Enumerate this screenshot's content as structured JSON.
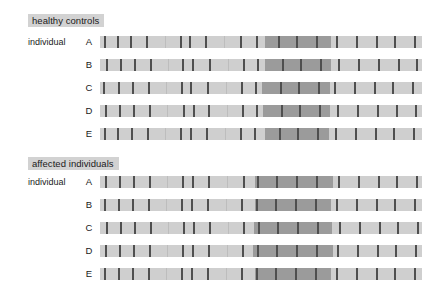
{
  "figure": {
    "width": 448,
    "height": 291,
    "background": "#ffffff",
    "track_color": "#cfcfcf",
    "shared_block_color": "#9b9b9b",
    "marker_color": "#6e6e6e",
    "title_chip_color": "#d2d2d2"
  },
  "panels": [
    {
      "id": "healthy-controls",
      "title": "healthy controls",
      "title_x": 28,
      "title_y": 14,
      "row_label_prefix": "individual",
      "prefix_x": 28,
      "prefix_y": 36,
      "rows": [
        {
          "letter": "A",
          "y": 36,
          "shared_blocks": [
            {
              "x": 265,
              "w": 66
            }
          ],
          "markers": [
            {
              "x": 104,
              "tone": "strong"
            },
            {
              "x": 117,
              "tone": "strong"
            },
            {
              "x": 130,
              "tone": "strong"
            },
            {
              "x": 146,
              "tone": "strong"
            },
            {
              "x": 165,
              "tone": "faint"
            },
            {
              "x": 180,
              "tone": "strong"
            },
            {
              "x": 189,
              "tone": "strong"
            },
            {
              "x": 205,
              "tone": "strong"
            },
            {
              "x": 224,
              "tone": "faint"
            },
            {
              "x": 240,
              "tone": "strong"
            },
            {
              "x": 256,
              "tone": "strong"
            },
            {
              "x": 278,
              "tone": "strong"
            },
            {
              "x": 296,
              "tone": "strong"
            },
            {
              "x": 316,
              "tone": "strong"
            },
            {
              "x": 336,
              "tone": "strong"
            },
            {
              "x": 356,
              "tone": "strong"
            },
            {
              "x": 376,
              "tone": "strong"
            },
            {
              "x": 394,
              "tone": "strong"
            },
            {
              "x": 414,
              "tone": "strong"
            }
          ]
        },
        {
          "letter": "B",
          "y": 59,
          "shared_blocks": [
            {
              "x": 265,
              "w": 66
            }
          ],
          "markers": [
            {
              "x": 106,
              "tone": "strong"
            },
            {
              "x": 120,
              "tone": "strong"
            },
            {
              "x": 134,
              "tone": "strong"
            },
            {
              "x": 150,
              "tone": "strong"
            },
            {
              "x": 168,
              "tone": "faint"
            },
            {
              "x": 182,
              "tone": "strong"
            },
            {
              "x": 192,
              "tone": "strong"
            },
            {
              "x": 209,
              "tone": "strong"
            },
            {
              "x": 228,
              "tone": "faint"
            },
            {
              "x": 243,
              "tone": "strong"
            },
            {
              "x": 257,
              "tone": "strong"
            },
            {
              "x": 282,
              "tone": "strong"
            },
            {
              "x": 300,
              "tone": "strong"
            },
            {
              "x": 320,
              "tone": "strong"
            },
            {
              "x": 338,
              "tone": "strong"
            },
            {
              "x": 358,
              "tone": "strong"
            },
            {
              "x": 378,
              "tone": "strong"
            },
            {
              "x": 398,
              "tone": "strong"
            },
            {
              "x": 416,
              "tone": "strong"
            }
          ]
        },
        {
          "letter": "C",
          "y": 82,
          "shared_blocks": [
            {
              "x": 262,
              "w": 68
            }
          ],
          "markers": [
            {
              "x": 103,
              "tone": "strong"
            },
            {
              "x": 118,
              "tone": "strong"
            },
            {
              "x": 132,
              "tone": "strong"
            },
            {
              "x": 148,
              "tone": "strong"
            },
            {
              "x": 166,
              "tone": "faint"
            },
            {
              "x": 181,
              "tone": "strong"
            },
            {
              "x": 190,
              "tone": "strong"
            },
            {
              "x": 207,
              "tone": "strong"
            },
            {
              "x": 226,
              "tone": "faint"
            },
            {
              "x": 241,
              "tone": "strong"
            },
            {
              "x": 255,
              "tone": "strong"
            },
            {
              "x": 280,
              "tone": "strong"
            },
            {
              "x": 298,
              "tone": "strong"
            },
            {
              "x": 318,
              "tone": "strong"
            },
            {
              "x": 334,
              "tone": "strong"
            },
            {
              "x": 354,
              "tone": "strong"
            },
            {
              "x": 374,
              "tone": "strong"
            },
            {
              "x": 392,
              "tone": "strong"
            },
            {
              "x": 412,
              "tone": "strong"
            }
          ]
        },
        {
          "letter": "D",
          "y": 105,
          "shared_blocks": [
            {
              "x": 263,
              "w": 67
            }
          ],
          "markers": [
            {
              "x": 105,
              "tone": "strong"
            },
            {
              "x": 119,
              "tone": "strong"
            },
            {
              "x": 133,
              "tone": "strong"
            },
            {
              "x": 149,
              "tone": "strong"
            },
            {
              "x": 167,
              "tone": "faint"
            },
            {
              "x": 183,
              "tone": "strong"
            },
            {
              "x": 193,
              "tone": "strong"
            },
            {
              "x": 208,
              "tone": "strong"
            },
            {
              "x": 227,
              "tone": "faint"
            },
            {
              "x": 242,
              "tone": "strong"
            },
            {
              "x": 256,
              "tone": "strong"
            },
            {
              "x": 281,
              "tone": "strong"
            },
            {
              "x": 299,
              "tone": "strong"
            },
            {
              "x": 319,
              "tone": "strong"
            },
            {
              "x": 337,
              "tone": "strong"
            },
            {
              "x": 357,
              "tone": "strong"
            },
            {
              "x": 377,
              "tone": "strong"
            },
            {
              "x": 396,
              "tone": "strong"
            },
            {
              "x": 415,
              "tone": "strong"
            }
          ]
        },
        {
          "letter": "E",
          "y": 128,
          "shared_blocks": [
            {
              "x": 265,
              "w": 64
            }
          ],
          "markers": [
            {
              "x": 104,
              "tone": "strong"
            },
            {
              "x": 117,
              "tone": "strong"
            },
            {
              "x": 131,
              "tone": "strong"
            },
            {
              "x": 147,
              "tone": "strong"
            },
            {
              "x": 165,
              "tone": "faint"
            },
            {
              "x": 180,
              "tone": "strong"
            },
            {
              "x": 190,
              "tone": "strong"
            },
            {
              "x": 206,
              "tone": "strong"
            },
            {
              "x": 225,
              "tone": "faint"
            },
            {
              "x": 240,
              "tone": "strong"
            },
            {
              "x": 254,
              "tone": "strong"
            },
            {
              "x": 279,
              "tone": "strong"
            },
            {
              "x": 297,
              "tone": "strong"
            },
            {
              "x": 317,
              "tone": "strong"
            },
            {
              "x": 335,
              "tone": "strong"
            },
            {
              "x": 355,
              "tone": "strong"
            },
            {
              "x": 375,
              "tone": "strong"
            },
            {
              "x": 393,
              "tone": "strong"
            },
            {
              "x": 413,
              "tone": "strong"
            }
          ]
        }
      ]
    },
    {
      "id": "affected-individuals",
      "title": "affected individuals",
      "title_x": 28,
      "title_y": 157,
      "row_label_prefix": "individual",
      "prefix_x": 28,
      "prefix_y": 176,
      "rows": [
        {
          "letter": "A",
          "y": 176,
          "shared_blocks": [
            {
              "x": 255,
              "w": 78
            }
          ],
          "markers": [
            {
              "x": 105,
              "tone": "strong"
            },
            {
              "x": 119,
              "tone": "strong"
            },
            {
              "x": 133,
              "tone": "strong"
            },
            {
              "x": 149,
              "tone": "strong"
            },
            {
              "x": 167,
              "tone": "faint"
            },
            {
              "x": 182,
              "tone": "strong"
            },
            {
              "x": 192,
              "tone": "strong"
            },
            {
              "x": 208,
              "tone": "strong"
            },
            {
              "x": 227,
              "tone": "faint"
            },
            {
              "x": 243,
              "tone": "strong"
            },
            {
              "x": 257,
              "tone": "strong"
            },
            {
              "x": 276,
              "tone": "strong"
            },
            {
              "x": 296,
              "tone": "strong"
            },
            {
              "x": 316,
              "tone": "strong"
            },
            {
              "x": 338,
              "tone": "strong"
            },
            {
              "x": 358,
              "tone": "strong"
            },
            {
              "x": 378,
              "tone": "strong"
            },
            {
              "x": 396,
              "tone": "strong"
            },
            {
              "x": 416,
              "tone": "strong"
            }
          ]
        },
        {
          "letter": "B",
          "y": 199,
          "shared_blocks": [
            {
              "x": 255,
              "w": 76
            }
          ],
          "markers": [
            {
              "x": 104,
              "tone": "strong"
            },
            {
              "x": 118,
              "tone": "strong"
            },
            {
              "x": 132,
              "tone": "strong"
            },
            {
              "x": 148,
              "tone": "strong"
            },
            {
              "x": 166,
              "tone": "faint"
            },
            {
              "x": 181,
              "tone": "strong"
            },
            {
              "x": 191,
              "tone": "strong"
            },
            {
              "x": 207,
              "tone": "strong"
            },
            {
              "x": 226,
              "tone": "faint"
            },
            {
              "x": 241,
              "tone": "strong"
            },
            {
              "x": 256,
              "tone": "strong"
            },
            {
              "x": 275,
              "tone": "strong"
            },
            {
              "x": 295,
              "tone": "strong"
            },
            {
              "x": 315,
              "tone": "strong"
            },
            {
              "x": 336,
              "tone": "strong"
            },
            {
              "x": 356,
              "tone": "strong"
            },
            {
              "x": 376,
              "tone": "strong"
            },
            {
              "x": 394,
              "tone": "strong"
            },
            {
              "x": 414,
              "tone": "strong"
            }
          ]
        },
        {
          "letter": "C",
          "y": 222,
          "shared_blocks": [
            {
              "x": 254,
              "w": 78
            }
          ],
          "markers": [
            {
              "x": 106,
              "tone": "strong"
            },
            {
              "x": 120,
              "tone": "strong"
            },
            {
              "x": 134,
              "tone": "strong"
            },
            {
              "x": 150,
              "tone": "strong"
            },
            {
              "x": 168,
              "tone": "faint"
            },
            {
              "x": 183,
              "tone": "strong"
            },
            {
              "x": 193,
              "tone": "strong"
            },
            {
              "x": 209,
              "tone": "strong"
            },
            {
              "x": 228,
              "tone": "faint"
            },
            {
              "x": 243,
              "tone": "strong"
            },
            {
              "x": 258,
              "tone": "strong"
            },
            {
              "x": 277,
              "tone": "strong"
            },
            {
              "x": 297,
              "tone": "strong"
            },
            {
              "x": 317,
              "tone": "strong"
            },
            {
              "x": 339,
              "tone": "strong"
            },
            {
              "x": 359,
              "tone": "strong"
            },
            {
              "x": 379,
              "tone": "strong"
            },
            {
              "x": 397,
              "tone": "strong"
            },
            {
              "x": 417,
              "tone": "strong"
            }
          ]
        },
        {
          "letter": "D",
          "y": 245,
          "shared_blocks": [
            {
              "x": 253,
              "w": 80
            }
          ],
          "markers": [
            {
              "x": 105,
              "tone": "strong"
            },
            {
              "x": 119,
              "tone": "strong"
            },
            {
              "x": 133,
              "tone": "strong"
            },
            {
              "x": 149,
              "tone": "strong"
            },
            {
              "x": 167,
              "tone": "faint"
            },
            {
              "x": 182,
              "tone": "strong"
            },
            {
              "x": 192,
              "tone": "strong"
            },
            {
              "x": 208,
              "tone": "strong"
            },
            {
              "x": 227,
              "tone": "faint"
            },
            {
              "x": 242,
              "tone": "strong"
            },
            {
              "x": 257,
              "tone": "strong"
            },
            {
              "x": 276,
              "tone": "strong"
            },
            {
              "x": 296,
              "tone": "strong"
            },
            {
              "x": 316,
              "tone": "strong"
            },
            {
              "x": 337,
              "tone": "strong"
            },
            {
              "x": 357,
              "tone": "strong"
            },
            {
              "x": 377,
              "tone": "strong"
            },
            {
              "x": 395,
              "tone": "strong"
            },
            {
              "x": 415,
              "tone": "strong"
            }
          ]
        },
        {
          "letter": "E",
          "y": 268,
          "shared_blocks": [
            {
              "x": 255,
              "w": 76
            }
          ],
          "markers": [
            {
              "x": 104,
              "tone": "strong"
            },
            {
              "x": 118,
              "tone": "strong"
            },
            {
              "x": 132,
              "tone": "strong"
            },
            {
              "x": 148,
              "tone": "strong"
            },
            {
              "x": 166,
              "tone": "faint"
            },
            {
              "x": 181,
              "tone": "strong"
            },
            {
              "x": 191,
              "tone": "strong"
            },
            {
              "x": 207,
              "tone": "strong"
            },
            {
              "x": 226,
              "tone": "faint"
            },
            {
              "x": 241,
              "tone": "strong"
            },
            {
              "x": 256,
              "tone": "strong"
            },
            {
              "x": 275,
              "tone": "strong"
            },
            {
              "x": 295,
              "tone": "strong"
            },
            {
              "x": 315,
              "tone": "strong"
            },
            {
              "x": 336,
              "tone": "strong"
            },
            {
              "x": 356,
              "tone": "strong"
            },
            {
              "x": 376,
              "tone": "strong"
            },
            {
              "x": 394,
              "tone": "strong"
            },
            {
              "x": 414,
              "tone": "strong"
            }
          ]
        }
      ]
    }
  ],
  "chart_data": {
    "type": "heatmap",
    "title": "",
    "xlabel": "",
    "ylabel": "",
    "groups": [
      "healthy controls",
      "affected individuals"
    ],
    "individuals": [
      "A",
      "B",
      "C",
      "D",
      "E"
    ],
    "track_x_start": 100,
    "track_x_end": 422,
    "shared_block_span_healthy": [
      262,
      331
    ],
    "shared_block_span_affected": [
      253,
      333
    ]
  }
}
